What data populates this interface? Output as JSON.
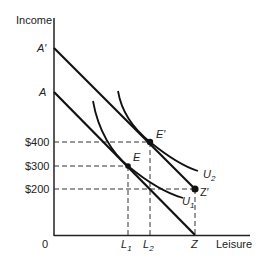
{
  "diagram": {
    "axes": {
      "y_label": "Income",
      "x_label": "Leisure",
      "origin_label": "0"
    },
    "y_ticks": [
      {
        "label": "$400",
        "y": 142
      },
      {
        "label": "$300",
        "y": 166
      },
      {
        "label": "$200",
        "y": 189
      }
    ],
    "y_points": [
      {
        "label": "A′",
        "y": 48
      },
      {
        "label": "A",
        "y": 92
      }
    ],
    "x_ticks": [
      {
        "label": "L",
        "sub": "1",
        "x": 128
      },
      {
        "label": "L",
        "sub": "2",
        "x": 150
      },
      {
        "label": "Z",
        "sub": "",
        "x": 195
      }
    ],
    "points": [
      {
        "label": "E",
        "x": 128,
        "y": 166
      },
      {
        "label": "E′",
        "x": 150,
        "y": 142
      },
      {
        "label": "Z′",
        "x": 195,
        "y": 189
      }
    ],
    "curves": [
      {
        "label": "U",
        "sub": "1"
      },
      {
        "label": "U",
        "sub": "2"
      }
    ],
    "lines": [
      {
        "name": "budget-line-A",
        "from": "A",
        "to": "Z"
      },
      {
        "name": "budget-line-A-prime",
        "from": "A′",
        "to": "Z′"
      }
    ]
  }
}
